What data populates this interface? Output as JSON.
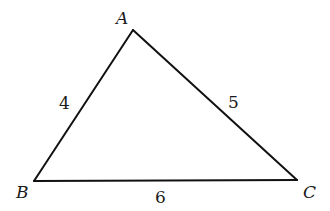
{
  "diagram": {
    "type": "triangle",
    "stroke_color": "#111111",
    "background": "#ffffff",
    "vertices": [
      {
        "name": "A",
        "x": 133,
        "y": 30
      },
      {
        "name": "B",
        "x": 34,
        "y": 181
      },
      {
        "name": "C",
        "x": 297,
        "y": 180
      }
    ],
    "vertex_labels": {
      "A": "A",
      "B": "B",
      "C": "C"
    },
    "sides": [
      {
        "from": "A",
        "to": "B",
        "length_label": "4"
      },
      {
        "from": "A",
        "to": "C",
        "length_label": "5"
      },
      {
        "from": "B",
        "to": "C",
        "length_label": "6"
      }
    ],
    "side_labels": {
      "AB": "4",
      "AC": "5",
      "BC": "6"
    }
  }
}
